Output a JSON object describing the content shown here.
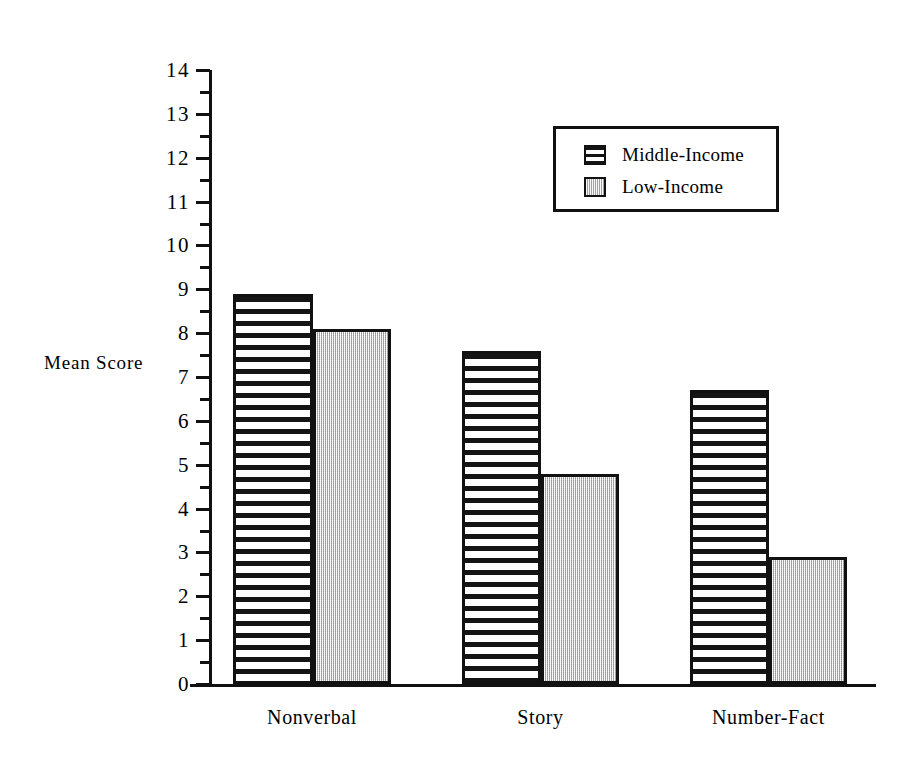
{
  "chart_data": {
    "type": "bar",
    "title": "",
    "subtitle": "",
    "xlabel": "",
    "ylabel": "Mean Score",
    "categories": [
      "Nonverbal",
      "Story",
      "Number-Fact"
    ],
    "series": [
      {
        "name": "Middle-Income",
        "values": [
          8.9,
          7.6,
          6.7
        ],
        "fill": "horizontal-stripes",
        "color": "#ffffff"
      },
      {
        "name": "Low-Income",
        "values": [
          8.1,
          4.8,
          2.9
        ],
        "fill": "gray-stipple",
        "color": "#d4d4d4"
      }
    ],
    "ylim": [
      0,
      14
    ],
    "ytick_labels": [
      "0",
      "1",
      "2",
      "3",
      "4",
      "5",
      "6",
      "7",
      "8",
      "9",
      "10",
      "11",
      "12",
      "13",
      "14"
    ],
    "ytick_values": [
      0,
      1,
      2,
      3,
      4,
      5,
      6,
      7,
      8,
      9,
      10,
      11,
      12,
      13,
      14
    ],
    "minor_ticks": true,
    "minor_tick_interval": 0.5,
    "grid": false,
    "legend_position": "top-right",
    "legend_entries": [
      "Middle-Income",
      "Low-Income"
    ],
    "axis_color": "#111111",
    "background": "#ffffff"
  },
  "legend": {
    "items": [
      {
        "label": "Middle-Income"
      },
      {
        "label": "Low-Income"
      }
    ]
  },
  "axes": {
    "y_title": "Mean Score"
  }
}
